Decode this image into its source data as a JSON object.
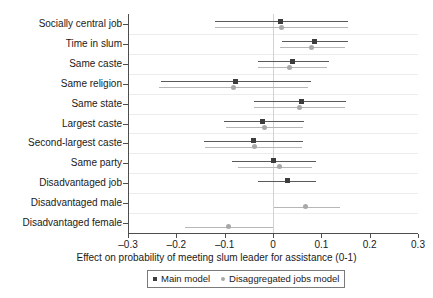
{
  "chart_data": {
    "type": "scatter",
    "title": "",
    "subtitle": "",
    "xlabel": "Effect on probability of meeting slum leader for assistance (0-1)",
    "ylabel": "",
    "xlim": [
      -0.3,
      0.3
    ],
    "xticks": [
      -0.3,
      -0.2,
      -0.1,
      0,
      0.1,
      0.2,
      0.3
    ],
    "xticklabels": [
      "–0.3",
      "–0.2",
      "–0.1",
      "0",
      "0.1",
      "0.2",
      "0.3"
    ],
    "grid": true,
    "grid_axis": "y",
    "zero_reference_line": 0,
    "orientation": "horizontal",
    "legend_position": "bottom-center",
    "categories": [
      "Socially central job",
      "Time in slum",
      "Same caste",
      "Same religion",
      "Same state",
      "Largest caste",
      "Second-largest caste",
      "Same party",
      "Disadvantaged job",
      "Disadvantaged male",
      "Disadvantaged female"
    ],
    "series": [
      {
        "name": "Main model",
        "marker": "square",
        "color": "#3d3d3d",
        "ci_color": "#5a5a5a",
        "values": [
          0.015,
          0.085,
          0.04,
          -0.078,
          0.058,
          -0.022,
          -0.04,
          0.0,
          0.03,
          null,
          null
        ],
        "ci_low": [
          -0.12,
          0.018,
          -0.032,
          -0.232,
          -0.04,
          -0.102,
          -0.142,
          -0.085,
          -0.032,
          null,
          null
        ],
        "ci_high": [
          0.155,
          0.155,
          0.115,
          0.078,
          0.152,
          0.065,
          0.062,
          0.088,
          0.088,
          null,
          null
        ]
      },
      {
        "name": "Disaggregated jobs model",
        "marker": "circle",
        "color": "#a8a8a8",
        "ci_color": "#b7b7b7",
        "values": [
          0.017,
          0.08,
          0.035,
          -0.082,
          0.055,
          -0.018,
          -0.038,
          0.013,
          null,
          0.068,
          -0.092
        ],
        "ci_low": [
          -0.12,
          0.015,
          -0.032,
          -0.235,
          -0.04,
          -0.098,
          -0.14,
          -0.072,
          null,
          0.002,
          -0.182
        ],
        "ci_high": [
          0.155,
          0.148,
          0.112,
          0.072,
          0.148,
          0.062,
          0.06,
          0.08,
          null,
          0.138,
          0.0
        ]
      }
    ]
  },
  "legend": {
    "items": [
      {
        "label": "Main model"
      },
      {
        "label": "Disaggregated jobs model"
      }
    ]
  }
}
